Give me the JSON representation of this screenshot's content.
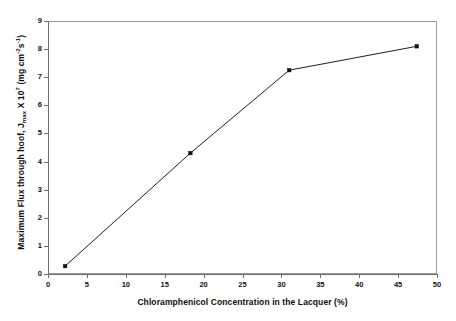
{
  "chart_data": {
    "type": "line",
    "title": "",
    "xlabel": "Chloramphenicol Concentration in the Lacquer (%)",
    "ylabel": "Maximum Flux through hoof, Jmax X 10^7 (mg cm^-2 s^-1)",
    "ylabel_parts": {
      "lead": "Maximum Flux through hoof, J",
      "sub1": "max",
      "mid": " X 10",
      "sup1": "7",
      "unit_open": " (mg cm",
      "sup2": "-2",
      "unit_s": "s",
      "sup3": "-1",
      "unit_close": ")"
    },
    "x": [
      2.2,
      18.3,
      31.0,
      47.4
    ],
    "values": [
      0.28,
      4.3,
      7.25,
      8.1
    ],
    "series": [
      {
        "name": "Maximum Flux",
        "points": [
          {
            "x": 2.2,
            "y": 0.28
          },
          {
            "x": 18.3,
            "y": 4.3
          },
          {
            "x": 31.0,
            "y": 7.25
          },
          {
            "x": 47.4,
            "y": 8.1
          }
        ]
      }
    ],
    "xlim": [
      0,
      50
    ],
    "ylim": [
      0,
      9
    ],
    "xticks": [
      0,
      5,
      10,
      15,
      20,
      25,
      30,
      35,
      40,
      45,
      50
    ],
    "yticks": [
      0,
      1,
      2,
      3,
      4,
      5,
      6,
      7,
      8,
      9
    ],
    "xtick_labels": [
      "0",
      "5",
      "10",
      "15",
      "20",
      "25",
      "30",
      "35",
      "40",
      "45",
      "50"
    ],
    "ytick_labels": [
      "0",
      "1",
      "2",
      "3",
      "4",
      "5",
      "6",
      "7",
      "8",
      "9"
    ],
    "grid": false,
    "legend": false,
    "legend_position": "none",
    "marker": "square",
    "line_color": "#202020",
    "marker_color": "#111111",
    "frame_color": "#9a9a9a",
    "background": "#ffffff"
  }
}
